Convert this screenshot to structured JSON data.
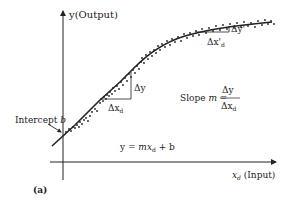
{
  "figure": {
    "panel_label": "(a)",
    "y_axis_label": "y(Output)",
    "x_axis_var": "x",
    "x_axis_sub": "d",
    "x_axis_suffix": "(Input)",
    "intercept_label_text": "Intercept ",
    "intercept_label_var": "b",
    "equation": {
      "lhs": "y = ",
      "m": "m",
      "x": "x",
      "sub": "d",
      "rhs": " + b"
    },
    "slope": {
      "prefix": "Slope ",
      "m": "m",
      "eq": " = ",
      "numerator": "Δy",
      "denominator_delta": "Δx",
      "denominator_sub": "d"
    },
    "delta_y": "Δy",
    "delta_x": "Δx",
    "delta_x_sub": "d",
    "delta_y_prime": "Δy'",
    "delta_x_prime": "Δx'",
    "delta_x_prime_sub": "d"
  },
  "colors": {
    "ink": "#222222",
    "background": "#ffffff"
  }
}
